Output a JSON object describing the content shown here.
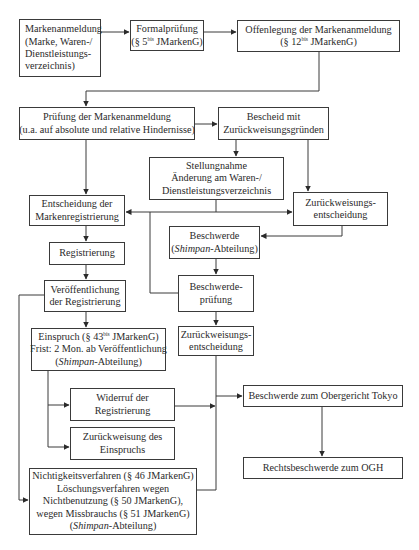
{
  "diagram": {
    "type": "flowchart",
    "nodes": {
      "application": {
        "lines": [
          "Markenanmeldung",
          "(Marke, Waren-/",
          "Dienstleistungs-",
          "verzeichnis)"
        ]
      },
      "formal_exam": {
        "lines": [
          "Formalprüfung"
        ],
        "ref_pre": "(§ 5",
        "ref_sup": "bis",
        "ref_post": " JMarkenG)"
      },
      "disclosure": {
        "lines": [
          "Offenlegung der Markenanmeldung"
        ],
        "ref_pre": "(§ 12",
        "ref_sup": "bis",
        "ref_post": " JMarkenG)"
      },
      "examination": {
        "lines": [
          "Prüfung der Markenanmeldung",
          "(u.a. auf absolute und relative Hindernisse)"
        ]
      },
      "notice": {
        "lines": [
          "Bescheid mit",
          "Zurückweisungsgründen"
        ]
      },
      "response": {
        "lines": [
          "Stellungnahme",
          "Änderung am Waren-/",
          "Dienstleistungsverzeichnis"
        ]
      },
      "decision_registration": {
        "lines": [
          "Entscheidung der",
          "Markenregistrierung"
        ]
      },
      "rejection_decision_1": {
        "lines": [
          "Zurückweisungs-",
          "entscheidung"
        ]
      },
      "appeal_shimpan": {
        "line1": "Beschwerde",
        "italic": "Shimpan",
        "rest": "-Abteilung)",
        "open": "("
      },
      "registration": {
        "lines": [
          "Registrierung"
        ]
      },
      "publication": {
        "lines": [
          "Veröffentlichung",
          "der Registrierung"
        ]
      },
      "appeal_exam": {
        "lines": [
          "Beschwerde-",
          "prüfung"
        ]
      },
      "opposition": {
        "ref_pre": "Einspruch (§ 43",
        "ref_sup": "bis",
        "ref_post": " JMarkenG)",
        "line2": "Frist: 2 Mon. ab Veröffentlichung",
        "italic": "Shimpan",
        "rest": "-Abteilung)",
        "open": "("
      },
      "rejection_decision_2": {
        "lines": [
          "Zurückweisungs-",
          "entscheidung"
        ]
      },
      "revocation": {
        "lines": [
          "Widerruf der",
          "Registrierung"
        ]
      },
      "appeal_high_court": {
        "lines": [
          "Beschwerde zum Obergericht Tokyo"
        ]
      },
      "opposition_rejected": {
        "lines": [
          "Zurückweisung des",
          "Einspruchs"
        ]
      },
      "legal_appeal_supreme": {
        "lines": [
          "Rechtsbeschwerde zum OGH"
        ]
      },
      "invalidation": {
        "lines": [
          "Nichtigkeitsverfahren (§ 46 JMarkenG)",
          "Löschungsverfahren wegen",
          "Nichtbenutzung (§ 50 JMarkenG),",
          "wegen Missbrauchs (§ 51 JMarkenG)"
        ],
        "italic": "Shimpan",
        "rest": "-Abteilung)",
        "open": "("
      }
    },
    "edges": [
      [
        "application",
        "formal_exam"
      ],
      [
        "formal_exam",
        "disclosure"
      ],
      [
        "disclosure",
        "examination"
      ],
      [
        "examination",
        "notice"
      ],
      [
        "examination",
        "decision_registration"
      ],
      [
        "notice",
        "response"
      ],
      [
        "notice",
        "rejection_decision_1"
      ],
      [
        "response",
        "decision_registration"
      ],
      [
        "response",
        "rejection_decision_1"
      ],
      [
        "rejection_decision_1",
        "appeal_shimpan"
      ],
      [
        "appeal_shimpan",
        "appeal_exam"
      ],
      [
        "appeal_exam",
        "decision_registration"
      ],
      [
        "decision_registration",
        "registration"
      ],
      [
        "registration",
        "publication"
      ],
      [
        "publication",
        "opposition"
      ],
      [
        "publication",
        "invalidation"
      ],
      [
        "appeal_exam",
        "rejection_decision_2"
      ],
      [
        "opposition",
        "revocation"
      ],
      [
        "opposition",
        "opposition_rejected"
      ],
      [
        "rejection_decision_2",
        "appeal_high_court"
      ],
      [
        "revocation",
        "appeal_high_court"
      ],
      [
        "invalidation",
        "appeal_high_court"
      ],
      [
        "appeal_high_court",
        "legal_appeal_supreme"
      ]
    ],
    "colors": {
      "stroke": "#3a3a3a",
      "text": "#2a2a2a",
      "background": "#ffffff"
    }
  }
}
